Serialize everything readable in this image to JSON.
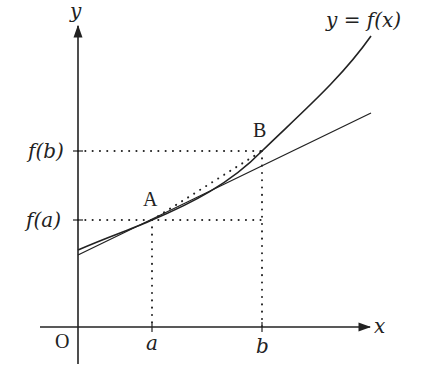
{
  "diagram": {
    "type": "function-graph-tangent-secant",
    "colors": {
      "stroke": "#222222",
      "background": "#ffffff"
    },
    "axes": {
      "x_label": "x",
      "y_label": "y",
      "origin_label": "O"
    },
    "curve_label": "y = f(x)",
    "points": {
      "A": {
        "label": "A",
        "x_label": "a",
        "y_label": "f(a)"
      },
      "B": {
        "label": "B",
        "x_label": "b",
        "y_label": "f(b)"
      }
    },
    "lines": {
      "curve": "y = f(x)",
      "tangent_at": "A",
      "chord": "A-B (dotted)"
    }
  }
}
